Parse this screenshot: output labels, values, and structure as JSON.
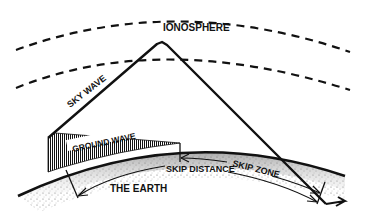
{
  "diagram": {
    "labels": {
      "ionosphere": "IONOSPHERE",
      "sky_wave": "SKY WAVE",
      "ground_wave": "GROUND WAVE",
      "skip_zone": "SKIP ZONE",
      "skip_distance": "SKIP DISTANCE",
      "earth": "THE EARTH"
    },
    "colors": {
      "ink": "#111111",
      "background": "#ffffff",
      "earth_shading": "#9a9a9a"
    }
  }
}
